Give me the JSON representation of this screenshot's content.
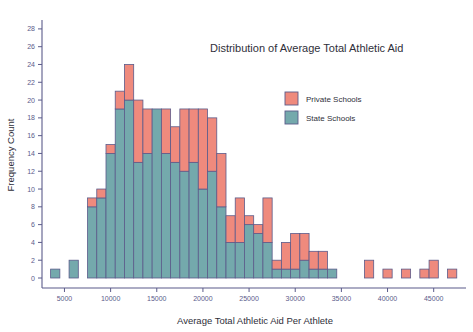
{
  "chart_data": {
    "type": "bar",
    "subtype": "stacked-histogram",
    "title": "Distribution of Average Total Athletic Aid",
    "xlabel": "Average Total Athletic Aid Per Athlete",
    "ylabel": "Frequency Count",
    "xlim": [
      3000,
      48500
    ],
    "ylim": [
      0,
      29
    ],
    "xticks": [
      5000,
      10000,
      15000,
      20000,
      25000,
      30000,
      35000,
      40000,
      45000
    ],
    "xtick_labels": [
      "5000",
      "10000",
      "15000",
      "20000",
      "25000",
      "30000",
      "35000",
      "40000",
      "45000"
    ],
    "yticks": [
      0,
      2,
      4,
      6,
      8,
      10,
      12,
      14,
      16,
      18,
      20,
      22,
      24,
      26,
      28
    ],
    "ytick_labels": [
      "0",
      "2",
      "4",
      "6",
      "8",
      "10",
      "12",
      "14",
      "16",
      "18",
      "20",
      "22",
      "24",
      "26",
      "28"
    ],
    "grid": false,
    "bin_width": 1000,
    "legend_position": "upper right inside",
    "legend_entries": [
      "Private Schools",
      "State Schools"
    ],
    "colors": {
      "private": "#ef8a7d",
      "state": "#74a9ac",
      "bar_border": "#5b5b8a",
      "axis": "#5b5b8a",
      "text": "#2f2f3a",
      "background": "#ffffff"
    },
    "series": [
      {
        "name": "State Schools",
        "color": "#74a9ac",
        "values": [
          1,
          0,
          2,
          0,
          8,
          9,
          14,
          19,
          20,
          13,
          14,
          19,
          14,
          13,
          12,
          13,
          10,
          12,
          8,
          4,
          4,
          6,
          5,
          4,
          1,
          1,
          1,
          2,
          1,
          1,
          1,
          0,
          0,
          0,
          0,
          0,
          0,
          0,
          0,
          0,
          0,
          0,
          0,
          0,
          0
        ]
      },
      {
        "name": "Private Schools",
        "color": "#ef8a7d",
        "values": [
          0,
          0,
          0,
          0,
          1,
          1,
          1,
          2,
          4,
          7,
          5,
          0,
          5,
          4,
          7,
          6,
          9,
          6,
          6,
          3,
          5,
          1,
          1,
          5,
          1,
          3,
          4,
          3,
          2,
          2,
          0,
          0,
          0,
          2,
          0,
          1,
          0,
          1,
          0,
          0,
          1,
          2,
          0,
          1,
          0
        ]
      }
    ],
    "bins": [
      {
        "bin_start": 3500,
        "state": 1,
        "private": 0
      },
      {
        "bin_start": 4500,
        "state": 0,
        "private": 0
      },
      {
        "bin_start": 5500,
        "state": 2,
        "private": 0
      },
      {
        "bin_start": 6500,
        "state": 0,
        "private": 0
      },
      {
        "bin_start": 7500,
        "state": 8,
        "private": 1
      },
      {
        "bin_start": 8500,
        "state": 9,
        "private": 1
      },
      {
        "bin_start": 9500,
        "state": 14,
        "private": 1
      },
      {
        "bin_start": 10500,
        "state": 19,
        "private": 2
      },
      {
        "bin_start": 11500,
        "state": 20,
        "private": 4
      },
      {
        "bin_start": 12500,
        "state": 13,
        "private": 7
      },
      {
        "bin_start": 13500,
        "state": 14,
        "private": 5
      },
      {
        "bin_start": 14500,
        "state": 19,
        "private": 0
      },
      {
        "bin_start": 15500,
        "state": 14,
        "private": 5
      },
      {
        "bin_start": 16500,
        "state": 13,
        "private": 4
      },
      {
        "bin_start": 17500,
        "state": 12,
        "private": 7
      },
      {
        "bin_start": 18500,
        "state": 13,
        "private": 6
      },
      {
        "bin_start": 19500,
        "state": 10,
        "private": 9
      },
      {
        "bin_start": 20500,
        "state": 12,
        "private": 6
      },
      {
        "bin_start": 21500,
        "state": 8,
        "private": 6
      },
      {
        "bin_start": 22500,
        "state": 4,
        "private": 3
      },
      {
        "bin_start": 23500,
        "state": 4,
        "private": 5
      },
      {
        "bin_start": 24500,
        "state": 6,
        "private": 1
      },
      {
        "bin_start": 25500,
        "state": 5,
        "private": 1
      },
      {
        "bin_start": 26500,
        "state": 4,
        "private": 5
      },
      {
        "bin_start": 27500,
        "state": 1,
        "private": 1
      },
      {
        "bin_start": 28500,
        "state": 1,
        "private": 3
      },
      {
        "bin_start": 29500,
        "state": 1,
        "private": 4
      },
      {
        "bin_start": 30500,
        "state": 2,
        "private": 3
      },
      {
        "bin_start": 31500,
        "state": 1,
        "private": 2
      },
      {
        "bin_start": 32500,
        "state": 1,
        "private": 2
      },
      {
        "bin_start": 33500,
        "state": 1,
        "private": 0
      },
      {
        "bin_start": 37500,
        "state": 0,
        "private": 2
      },
      {
        "bin_start": 39500,
        "state": 0,
        "private": 1
      },
      {
        "bin_start": 41500,
        "state": 0,
        "private": 1
      },
      {
        "bin_start": 43500,
        "state": 0,
        "private": 1
      },
      {
        "bin_start": 44500,
        "state": 0,
        "private": 2
      },
      {
        "bin_start": 46500,
        "state": 0,
        "private": 1
      }
    ],
    "max_total": 27,
    "max_total_bin_start": 15500
  },
  "legend": {
    "items": [
      {
        "label": "Private Schools",
        "color": "#ef8a7d"
      },
      {
        "label": "State Schools",
        "color": "#74a9ac"
      }
    ]
  }
}
